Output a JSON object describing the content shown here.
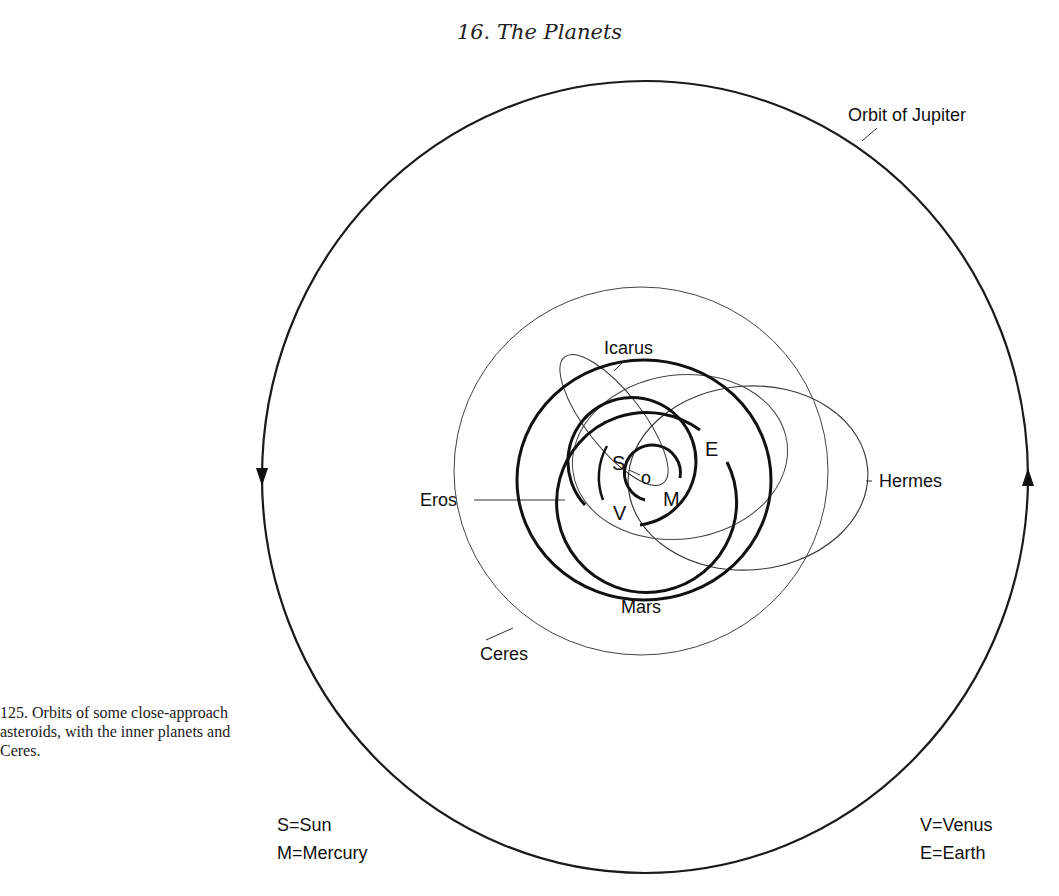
{
  "header": {
    "title": "16. The Planets"
  },
  "caption": {
    "text": "125. Orbits of some close-approach asteroids, with the inner planets and Ceres."
  },
  "labels": {
    "jupiter": "Orbit of Jupiter",
    "icarus": "Icarus",
    "hermes": "Hermes",
    "eros": "Eros",
    "ceres": "Ceres",
    "mars": "Mars",
    "sun": "S",
    "mercury": "M",
    "venus": "V",
    "earth": "E",
    "sun_marker": "o"
  },
  "legend": {
    "left": [
      {
        "key": "S",
        "sep": "=",
        "value": "Sun"
      },
      {
        "key": "M",
        "sep": "=",
        "value": "Mercury"
      }
    ],
    "right": [
      {
        "key": "V",
        "sep": "=",
        "value": "Venus"
      },
      {
        "key": "E",
        "sep": "=",
        "value": "Earth"
      }
    ]
  },
  "colors": {
    "ink": "#111111",
    "background": "#ffffff"
  }
}
